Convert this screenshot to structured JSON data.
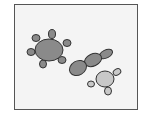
{
  "figure": {
    "colors": {
      "frame_border": "#555555",
      "background": "#f4f4f4",
      "dark_fill": "#8a8a8a",
      "light_fill": "#c8c8c8",
      "outline": "#333333"
    },
    "objects": [
      {
        "name": "large-cell-with-lobes",
        "fill": "dark",
        "lobes": 6
      },
      {
        "name": "chain-of-three-ovals",
        "fill": "dark",
        "segments": 3
      },
      {
        "name": "small-cell-with-lobes",
        "fill": "light",
        "lobes": 3
      }
    ]
  }
}
